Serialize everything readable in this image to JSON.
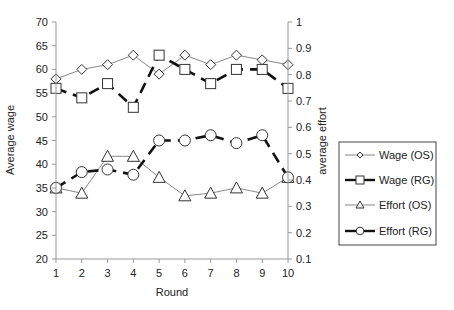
{
  "chart_data": {
    "type": "line",
    "title": "",
    "xlabel": "Round",
    "ylabel": "Average wage",
    "y2label": "average effort",
    "x": [
      1,
      2,
      3,
      4,
      5,
      6,
      7,
      8,
      9,
      10
    ],
    "xticks": [
      "1",
      "2",
      "3",
      "4",
      "5",
      "6",
      "7",
      "8",
      "9",
      "10"
    ],
    "ylim": [
      20,
      70
    ],
    "yticks": [
      "20",
      "25",
      "30",
      "35",
      "40",
      "45",
      "50",
      "55",
      "60",
      "65",
      "70"
    ],
    "y2lim": [
      0.1,
      1.0
    ],
    "y2ticks": [
      "0.1",
      "0.2",
      "0.3",
      "0.4",
      "0.5",
      "0.6",
      "0.7",
      "0.8",
      "0.9",
      "1"
    ],
    "grid": false,
    "legend_position": "right",
    "series": [
      {
        "name": "Wage (OS)",
        "axis": "left",
        "marker": "diamond",
        "line": "thin-solid",
        "values": [
          58,
          60,
          61,
          63,
          59,
          63,
          61,
          63,
          62,
          61
        ]
      },
      {
        "name": "Wage (RG)",
        "axis": "left",
        "marker": "square",
        "line": "thick-dashed",
        "values": [
          56,
          54,
          57,
          52,
          63,
          60,
          57,
          60,
          60,
          56
        ]
      },
      {
        "name": "Effort (OS)",
        "axis": "right",
        "marker": "triangle",
        "line": "thin-solid",
        "values": [
          0.37,
          0.35,
          0.49,
          0.49,
          0.41,
          0.34,
          0.35,
          0.37,
          0.35,
          0.41
        ]
      },
      {
        "name": "Effort (RG)",
        "axis": "right",
        "marker": "circle",
        "line": "thick-dashed",
        "values": [
          0.37,
          0.43,
          0.44,
          0.42,
          0.55,
          0.55,
          0.57,
          0.54,
          0.57,
          0.41
        ]
      }
    ]
  },
  "colors": {
    "axis": "#999999",
    "thin_line": "#888888",
    "thick_line": "#111111",
    "marker_stroke": "#333333",
    "legend_border": "#444444"
  }
}
